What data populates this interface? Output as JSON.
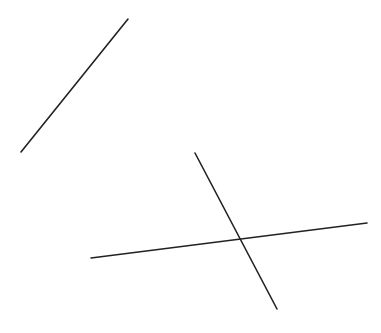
{
  "drawing": {
    "description": "Line sketch of three straight strokes on a white background",
    "background_color": "#ffffff",
    "stroke_color": "#222222",
    "strokes": [
      {
        "name": "diagonal-stroke",
        "label": "Isolated diagonal line (upper-left)"
      },
      {
        "name": "horizontal-stroke",
        "label": "Near-horizontal line (lower)"
      },
      {
        "name": "steep-stroke",
        "label": "Steep line crossing the horizontal line"
      }
    ]
  }
}
